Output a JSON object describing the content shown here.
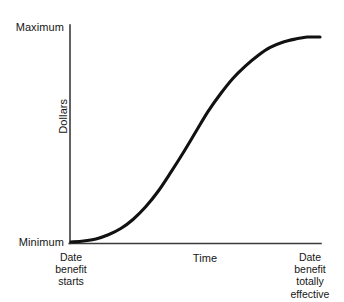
{
  "chart_data": {
    "type": "line",
    "title": "",
    "subtitle": "",
    "xlabel": "Time",
    "ylabel": "Dollars",
    "grid": false,
    "legend": "none",
    "y_axis": {
      "label": "Dollars",
      "tick_labels": [
        "Minimum",
        "Maximum"
      ],
      "min_label": "Minimum",
      "max_label": "Maximum",
      "ylim": [
        0,
        1
      ]
    },
    "x_axis": {
      "label": "Time",
      "tick_labels": [
        "Date benefit starts",
        "Date benefit totally effective"
      ],
      "start_label": "Date benefit starts",
      "end_label": "Date benefit totally effective",
      "xlim": [
        0,
        1
      ]
    },
    "series": [
      {
        "name": "Benefit value",
        "color": "#111111",
        "x": [
          0.0,
          0.05,
          0.1,
          0.15,
          0.2,
          0.25,
          0.3,
          0.35,
          0.4,
          0.45,
          0.5,
          0.55,
          0.6,
          0.65,
          0.7,
          0.75,
          0.8,
          0.85,
          0.9,
          0.95,
          1.0
        ],
        "values": [
          0.0,
          0.005,
          0.015,
          0.035,
          0.065,
          0.11,
          0.17,
          0.245,
          0.335,
          0.43,
          0.53,
          0.63,
          0.715,
          0.79,
          0.85,
          0.9,
          0.94,
          0.965,
          0.98,
          0.99,
          0.99
        ]
      }
    ],
    "annotations": {
      "shape": "S-curve (sigmoid) rising from Minimum to Maximum",
      "inflection_x": 0.5
    }
  },
  "labels": {
    "maximum": "Maximum",
    "minimum": "Minimum",
    "dollars": "Dollars",
    "time": "Time",
    "date_benefit_starts": "Date\nbenefit\nstarts",
    "date_benefit_starts_line1": "Date",
    "date_benefit_starts_line2": "benefit",
    "date_benefit_starts_line3": "starts",
    "date_benefit_totally_effective_line1": "Date",
    "date_benefit_totally_effective_line2": "benefit",
    "date_benefit_totally_effective_line3": "totally",
    "date_benefit_totally_effective_line4": "effective"
  },
  "colors": {
    "background": "#ffffff",
    "curve": "#111111",
    "axis": "#3b3b3b",
    "text": "#161616"
  }
}
